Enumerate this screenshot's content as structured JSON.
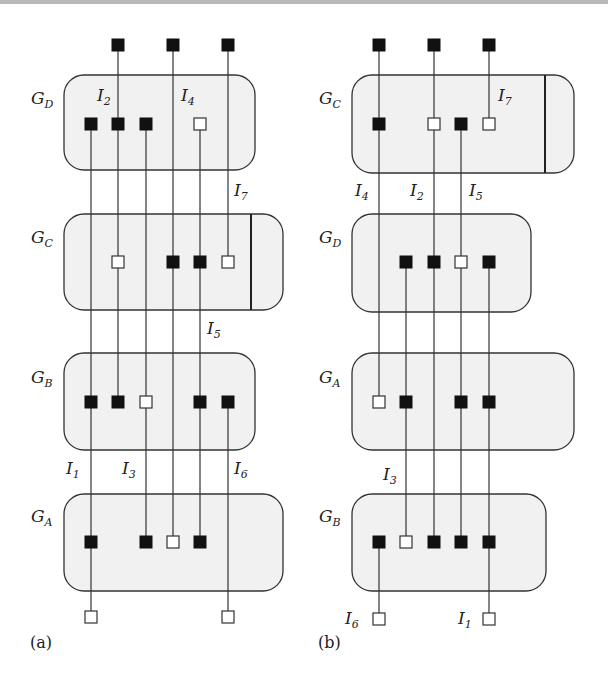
{
  "figure": {
    "panels": [
      {
        "id": "a",
        "caption": "(a)",
        "groups": [
          {
            "name": "G",
            "sub": "D"
          },
          {
            "name": "G",
            "sub": "C"
          },
          {
            "name": "G",
            "sub": "B"
          },
          {
            "name": "G",
            "sub": "A"
          }
        ],
        "interfaces": [
          {
            "name": "I",
            "sub": "2"
          },
          {
            "name": "I",
            "sub": "4"
          },
          {
            "name": "I",
            "sub": "7"
          },
          {
            "name": "I",
            "sub": "5"
          },
          {
            "name": "I",
            "sub": "1"
          },
          {
            "name": "I",
            "sub": "3"
          },
          {
            "name": "I",
            "sub": "6"
          }
        ]
      },
      {
        "id": "b",
        "caption": "(b)",
        "groups": [
          {
            "name": "G",
            "sub": "C"
          },
          {
            "name": "G",
            "sub": "D"
          },
          {
            "name": "G",
            "sub": "A"
          },
          {
            "name": "G",
            "sub": "B"
          }
        ],
        "interfaces": [
          {
            "name": "I",
            "sub": "7"
          },
          {
            "name": "I",
            "sub": "4"
          },
          {
            "name": "I",
            "sub": "2"
          },
          {
            "name": "I",
            "sub": "5"
          },
          {
            "name": "I",
            "sub": "3"
          },
          {
            "name": "I",
            "sub": "6"
          },
          {
            "name": "I",
            "sub": "1"
          }
        ]
      }
    ],
    "colors": {
      "box_fill": "#f1f1f1",
      "stroke": "#333333",
      "filled_node": "#111111",
      "open_node": "#ffffff"
    }
  }
}
